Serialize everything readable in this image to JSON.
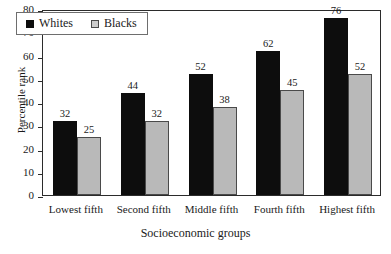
{
  "chart_data": {
    "type": "bar",
    "title": "",
    "xlabel": "Socioeconomic groups",
    "ylabel": "Percentile rank",
    "categories": [
      "Lowest fifth",
      "Second fifth",
      "Middle fifth",
      "Fourth fifth",
      "Highest fifth"
    ],
    "series": [
      {
        "name": "Whites",
        "values": [
          32,
          44,
          52,
          62,
          76
        ],
        "color": "#0d0d0d"
      },
      {
        "name": "Blacks",
        "values": [
          25,
          32,
          38,
          45,
          52
        ],
        "color": "#b9b9b9"
      }
    ],
    "ylim": [
      0,
      80
    ],
    "yticks": [
      0,
      10,
      20,
      30,
      40,
      50,
      60,
      70,
      80
    ],
    "ytick_labels": [
      "0",
      "10",
      "20",
      "30",
      "40",
      "50",
      "60",
      "70",
      "80"
    ],
    "grid": false,
    "legend_position": "top-left",
    "data_labels": true
  },
  "axes": {
    "y_title": "Percentile rank",
    "x_title": "Socioeconomic groups"
  },
  "legend": {
    "entries": [
      {
        "label": "Whites",
        "swatch": "black-square-icon"
      },
      {
        "label": "Blacks",
        "swatch": "gray-square-icon"
      }
    ]
  }
}
